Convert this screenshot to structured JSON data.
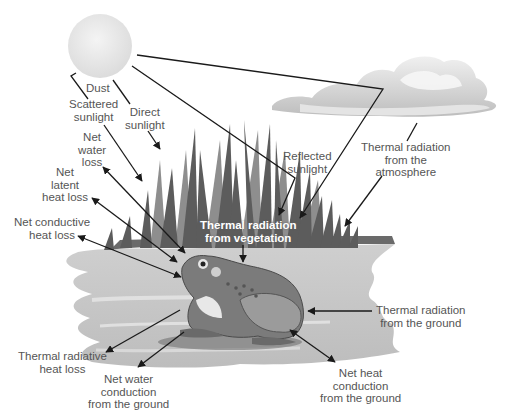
{
  "diagram": {
    "elements": {
      "sun": "sun",
      "cloud": "cloud",
      "vegetation": "reeds",
      "ground": "pond shore",
      "animal": "frog"
    },
    "labels": {
      "dust": "Dust",
      "scattered_sunlight": [
        "Scattered",
        "sunlight"
      ],
      "direct_sunlight": [
        "Direct",
        "sunlight"
      ],
      "net_water_loss": [
        "Net",
        "water",
        "loss"
      ],
      "net_latent_heat_loss": [
        "Net",
        "latent",
        "heat loss"
      ],
      "net_conductive_heat_loss": [
        "Net conductive",
        "heat loss"
      ],
      "reflected_sunlight": [
        "Reflected",
        "sunlight"
      ],
      "thermal_radiation_atmosphere": [
        "Thermal radiation",
        "from the",
        "atmosphere"
      ],
      "thermal_radiation_vegetation": [
        "Thermal radiation",
        "from vegetation"
      ],
      "thermal_radiation_ground": [
        "Thermal radiation",
        "from the ground"
      ],
      "thermal_radiative_heat_loss": [
        "Thermal radiative",
        "heat loss"
      ],
      "net_water_conduction_ground": [
        "Net water",
        "conduction",
        "from the ground"
      ],
      "net_heat_conduction_ground": [
        "Net heat",
        "conduction",
        "from the ground"
      ]
    },
    "colors": {
      "line": "#1a1a1a",
      "label_text": "#555555",
      "sun": "#e6e6e6",
      "cloud": "#d0d0d0",
      "reeds_dark": "#5a5a5a",
      "reeds_light": "#8a8a8a",
      "ground": "#c4c4c4",
      "frog_body": "#7b7b7b"
    }
  }
}
